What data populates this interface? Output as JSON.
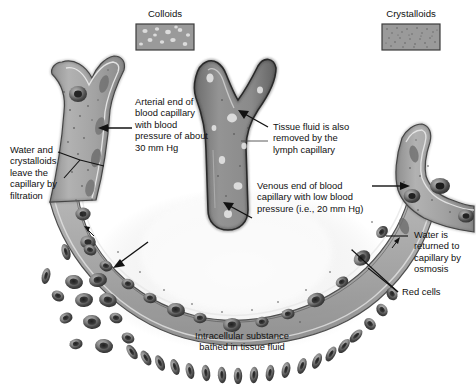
{
  "figure": {
    "width": 476,
    "height": 384,
    "background": "#ffffff"
  },
  "swatches": [
    {
      "name": "colloids",
      "label": "Colloids",
      "fill": "#9a9a9a",
      "border": "#3c3c3c",
      "particle_color": "#d8d8d8",
      "particle_style": "large-light-blobs"
    },
    {
      "name": "crystalloids",
      "label": "Crystalloids",
      "fill": "#9a9a9a",
      "border": "#3c3c3c",
      "particle_color": "#5a5a5a",
      "particle_style": "fine-dark-speckles"
    }
  ],
  "labels": [
    {
      "name": "arterial-end",
      "lines": [
        "Arterial end of",
        "blood capillary",
        "with blood",
        "pressure of about",
        "30 mm Hg"
      ]
    },
    {
      "name": "water-crystalloids",
      "lines": [
        "Water and",
        "crystalloids",
        "leave the",
        "capillary by",
        "filtration"
      ]
    },
    {
      "name": "tissue-fluid-lymph",
      "lines": [
        "Tissue fluid is also",
        "removed by the",
        "lymph capillary"
      ]
    },
    {
      "name": "venous-end",
      "lines": [
        "Venous end of blood",
        "capillary with low blood",
        "pressure (i.e., 20 mm Hg)"
      ]
    },
    {
      "name": "water-returned",
      "lines": [
        "Water is",
        "returned to",
        "capillary by",
        "osmosis"
      ]
    },
    {
      "name": "red-cells",
      "lines": [
        "Red cells"
      ]
    },
    {
      "name": "intracellular-substance",
      "lines": [
        "Intracellular substance",
        "bathed in tissue fluid"
      ]
    }
  ],
  "label_text": {
    "arterial_end": "Arterial end of\nblood capillary\nwith blood\npressure of about\n30 mm Hg",
    "water_crystalloids": "Water and\ncrystalloids\nleave the\ncapillary by\nfiltration",
    "tissue_fluid_lymph": "Tissue fluid is also\nremoved by the\nlymph capillary",
    "venous_end": "Venous end of blood\ncapillary with low blood\npressure (i.e., 20 mm Hg)",
    "water_returned": "Water is\nreturned to\ncapillary by\nosmosis",
    "red_cells": "Red cells",
    "intracellular_substance": "Intracellular substance\nbathed in tissue fluid",
    "colloids": "Colloids",
    "crystalloids": "Crystalloids"
  },
  "structures": [
    {
      "name": "arterial-capillary",
      "description": "Y-branched blood capillary, left side, gray lumen with dark outline and red cells"
    },
    {
      "name": "lymph-capillary",
      "description": "Dark branched blind-ended lymph capillary, center, with light blobs"
    },
    {
      "name": "venous-capillary",
      "description": "Branched blood capillary, right side, with red cells"
    },
    {
      "name": "capillary-bed-arc",
      "description": "U-shaped capillary band joining arterial and venous ends"
    },
    {
      "name": "tissue-fluid-field",
      "description": "Light diffuse tissue fluid region in the centre of the U"
    },
    {
      "name": "red-cell-cluster",
      "description": "Free red blood cells outside capillary at lower left"
    },
    {
      "name": "red-cell-chain",
      "description": "Arc-shaped chain of red cells along the bottom"
    }
  ],
  "colors": {
    "capillary_fill": "#a8a8a8",
    "capillary_outline": "#2e2e2e",
    "lymph_fill": "#8d8d8d",
    "lymph_outline": "#262626",
    "red_cell_dark": "#3a3a3a",
    "red_cell_mid": "#6e6e6e",
    "red_cell_light": "#a9a9a9",
    "tissue_fluid": "#efefef",
    "text": "#111111",
    "leader_line": "#1a1a1a"
  }
}
